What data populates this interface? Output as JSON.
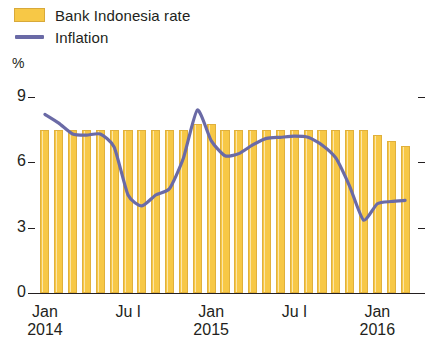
{
  "legend": {
    "items": [
      {
        "label": "Bank Indonesia rate",
        "marker": "bar-swatch",
        "color": "#f7c846"
      },
      {
        "label": "Inflation",
        "marker": "line-swatch",
        "color": "#6a6aa6"
      }
    ]
  },
  "axis": {
    "unit": "%",
    "y_ticks": [
      "9",
      "6",
      "3",
      "0"
    ]
  },
  "chart_data": {
    "type": "bar",
    "title": "",
    "subtitle": "",
    "xlabel": "",
    "ylabel": "%",
    "ylim": [
      0,
      9
    ],
    "y_ticks": [
      0,
      3,
      6,
      9
    ],
    "grid": false,
    "legend_position": "top-left",
    "x_tick_labels": [
      {
        "label": "Jan",
        "year": "2014",
        "index": 0
      },
      {
        "label": "Ju l",
        "year": "",
        "index": 6
      },
      {
        "label": "Jan",
        "year": "2015",
        "index": 12
      },
      {
        "label": "Ju l",
        "year": "",
        "index": 18
      },
      {
        "label": "Jan",
        "year": "2016",
        "index": 24
      }
    ],
    "categories": [
      "Jan 2014",
      "Feb 2014",
      "Mar 2014",
      "Apr 2014",
      "May 2014",
      "Jun 2014",
      "Jul 2014",
      "Aug 2014",
      "Sep 2014",
      "Oct 2014",
      "Nov 2014",
      "Dec 2014",
      "Jan 2015",
      "Feb 2015",
      "Mar 2015",
      "Apr 2015",
      "May 2015",
      "Jun 2015",
      "Jul 2015",
      "Aug 2015",
      "Sep 2015",
      "Oct 2015",
      "Nov 2015",
      "Dec 2015",
      "Jan 2016",
      "Feb 2016",
      "Mar 2016"
    ],
    "series": [
      {
        "name": "Bank Indonesia rate",
        "type": "bar",
        "color": "#f7c846",
        "values": [
          7.5,
          7.5,
          7.5,
          7.5,
          7.5,
          7.5,
          7.5,
          7.5,
          7.5,
          7.5,
          7.5,
          7.75,
          7.75,
          7.5,
          7.5,
          7.5,
          7.5,
          7.5,
          7.5,
          7.5,
          7.5,
          7.5,
          7.5,
          7.5,
          7.25,
          7.0,
          6.75
        ]
      },
      {
        "name": "Inflation",
        "type": "line",
        "color": "#6a6aa6",
        "values": [
          8.2,
          7.8,
          7.3,
          7.25,
          7.3,
          6.7,
          4.5,
          4.0,
          4.5,
          4.8,
          6.2,
          8.4,
          7.0,
          6.3,
          6.4,
          6.8,
          7.1,
          7.15,
          7.2,
          7.15,
          6.8,
          6.2,
          4.9,
          3.35,
          4.1,
          4.2,
          4.25
        ]
      }
    ]
  },
  "colors": {
    "bar_fill": "#f7c846",
    "bar_edge": "#e0b03c",
    "line": "#6a6aa6",
    "axis": "#231f20",
    "background": "#ffffff"
  }
}
